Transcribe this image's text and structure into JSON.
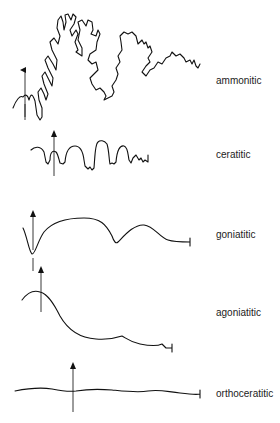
{
  "diagram": {
    "type": "suture-pattern-comparison",
    "rows": [
      {
        "id": "ammonitic",
        "label": "ammonitic",
        "label_y": 82
      },
      {
        "id": "ceratitic",
        "label": "ceratitic",
        "label_y": 155
      },
      {
        "id": "goniatitic",
        "label": "goniatitic",
        "label_y": 235
      },
      {
        "id": "agoniatitic",
        "label": "agoniatitic",
        "label_y": 310
      },
      {
        "id": "orthoceratitic",
        "label": "orthoceratitic",
        "label_y": 388
      }
    ],
    "arrow_meaning": "venter direction marker"
  }
}
